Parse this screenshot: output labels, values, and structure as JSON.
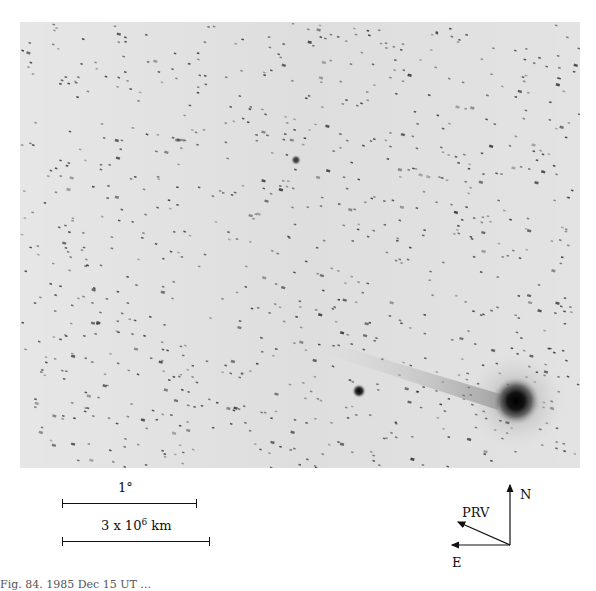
{
  "figure": {
    "type": "astronomical photograph (negative, comet field)",
    "caption_visible": "Fig. 84. 1985 Dec 15 UT …",
    "photo": {
      "background": "#dcdcdc",
      "star_color": "#3a3a3a",
      "comet_head": {
        "x": 496,
        "y": 379,
        "radius": 20
      },
      "secondary_object": {
        "x": 339,
        "y": 369,
        "radius": 5
      },
      "faint_object": {
        "x": 276,
        "y": 138,
        "radius": 4
      }
    },
    "scale_bars": [
      {
        "label": "1°",
        "length_px": 135
      },
      {
        "label_base": "3 x 10",
        "label_exp": "6",
        "label_unit": "km",
        "length_px": 148
      }
    ],
    "compass": {
      "north_label": "N",
      "east_label": "E",
      "prv_label": "PRV"
    }
  }
}
